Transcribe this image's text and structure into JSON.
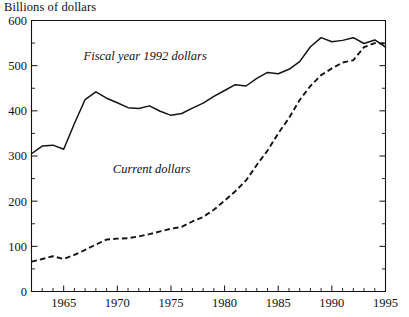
{
  "chart_data": {
    "type": "line",
    "title": "",
    "ylabel": "Billions of dollars",
    "xlabel": "",
    "xlim": [
      1962,
      1995
    ],
    "ylim": [
      0,
      600
    ],
    "yticks": [
      0,
      100,
      200,
      300,
      400,
      500,
      600
    ],
    "ytick_labels": [
      "0",
      "100",
      "200",
      "300",
      "400",
      "500",
      "600"
    ],
    "yminor_step": 50,
    "xticks": [
      1965,
      1970,
      1975,
      1980,
      1985,
      1990,
      1995
    ],
    "xtick_labels": [
      "1965",
      "1970",
      "1975",
      "1980",
      "1985",
      "1990",
      "1995"
    ],
    "xminor_step": 1,
    "grid": false,
    "legend_position": "inline-annotation",
    "x": [
      1962,
      1963,
      1964,
      1965,
      1966,
      1967,
      1968,
      1969,
      1970,
      1971,
      1972,
      1973,
      1974,
      1975,
      1976,
      1977,
      1978,
      1979,
      1980,
      1981,
      1982,
      1983,
      1984,
      1985,
      1986,
      1987,
      1988,
      1989,
      1990,
      1991,
      1992,
      1993,
      1994,
      1995
    ],
    "series": [
      {
        "name": "Fiscal year 1992 dollars",
        "style": "solid",
        "label_text": "Fiscal year 1992 dollars",
        "label_x": 1972.6,
        "label_y": 512,
        "values": [
          305,
          322,
          324,
          315,
          372,
          425,
          442,
          428,
          418,
          407,
          405,
          411,
          399,
          390,
          394,
          406,
          417,
          432,
          445,
          458,
          455,
          472,
          485,
          482,
          492,
          509,
          542,
          562,
          553,
          556,
          562,
          549,
          557,
          541
        ]
      },
      {
        "name": "Current dollars",
        "style": "dashed",
        "label_text": "Current dollars",
        "label_x": 1973.2,
        "label_y": 262,
        "values": [
          66,
          72,
          78,
          72,
          81,
          92,
          104,
          115,
          117,
          118,
          122,
          127,
          133,
          139,
          143,
          155,
          165,
          181,
          201,
          222,
          246,
          280,
          312,
          350,
          384,
          424,
          455,
          479,
          494,
          507,
          512,
          541,
          550,
          549
        ]
      }
    ],
    "crossover_note": "series cross near 1991-1992",
    "solid_series_end_value": 490,
    "dashed_series_end_value": 548
  }
}
